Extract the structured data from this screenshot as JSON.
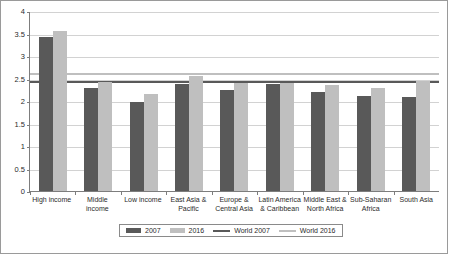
{
  "chart_data": {
    "type": "bar",
    "title": "",
    "xlabel": "",
    "ylabel": "",
    "ylim": [
      0,
      4
    ],
    "ytick_step": 0.5,
    "grid": true,
    "legend_position": "bottom",
    "categories": [
      "High income",
      "Middle income",
      "Low income",
      "East Asia & Pacific",
      "Europe & Central Asia",
      "Latin America & Caribbean",
      "Middle East & North Africa",
      "Sub-Saharan Africa",
      "South Asia"
    ],
    "ytick_labels": [
      "0",
      "0.5",
      "1",
      "1.5",
      "2",
      "2.5",
      "3",
      "3.5",
      "4"
    ],
    "ytick_values": [
      0,
      0.5,
      1,
      1.5,
      2,
      2.5,
      3,
      3.5,
      4
    ],
    "series": [
      {
        "name": "2007",
        "color": "#595959",
        "values": [
          3.43,
          2.29,
          1.98,
          2.37,
          2.25,
          2.37,
          2.21,
          2.12,
          2.08
        ]
      },
      {
        "name": "2016",
        "color": "#bfbfbf",
        "values": [
          3.55,
          2.43,
          2.16,
          2.56,
          2.39,
          2.4,
          2.36,
          2.29,
          2.45
        ]
      }
    ],
    "reference_lines": [
      {
        "name": "World 2007",
        "value": 2.47,
        "color": "#595959"
      },
      {
        "name": "World 2016",
        "value": 2.64,
        "color": "#bfbfbf"
      }
    ],
    "legend": [
      {
        "label": "2007",
        "marker": "bar",
        "color": "#595959"
      },
      {
        "label": "2016",
        "marker": "bar",
        "color": "#bfbfbf"
      },
      {
        "label": "World 2007",
        "marker": "line",
        "color": "#595959"
      },
      {
        "label": "World 2016",
        "marker": "line",
        "color": "#bfbfbf"
      }
    ]
  }
}
